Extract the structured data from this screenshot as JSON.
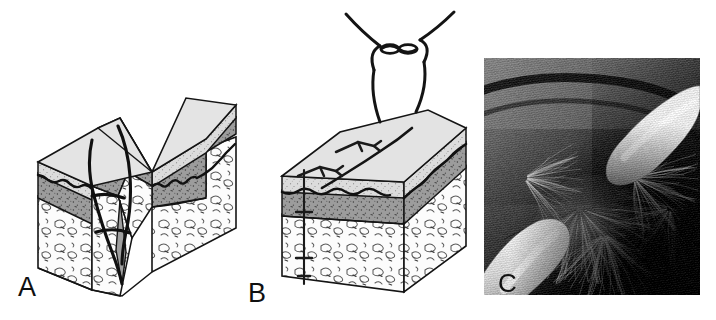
{
  "figure": {
    "kind": "medical-illustration-figure",
    "panel_count": 3,
    "background_color": "#ffffff",
    "width": 716,
    "height": 320
  },
  "panels": [
    {
      "id": "A",
      "label": "A",
      "label_x": 18,
      "label_y": 296,
      "title": "Gaping wound cross-section with suture needle path",
      "type": "line-illustration",
      "description": "Three-dimensional block diagram of skin split open by a deep V-shaped laceration. A curved suture thread loops through the wound edges from the epidermal surface down into the subcutaneous layer.",
      "layers": [
        {
          "name": "epidermis",
          "fill": "#d8d8d8",
          "texture": "fine stipple",
          "order": 1
        },
        {
          "name": "dermis",
          "fill": "#9a9a9a",
          "texture": "dense stipple with dashes",
          "order": 2
        },
        {
          "name": "subcutaneous-fat",
          "fill": "#fbfbfb",
          "texture": "lobulated squiggles",
          "order": 3
        }
      ],
      "features": [
        "gaping-wound",
        "suture-thread",
        "needle-path",
        "wavy-dermal-junction"
      ]
    },
    {
      "id": "B",
      "label": "B",
      "label_x": 248,
      "label_y": 302,
      "title": "Closed wound with tied suture knot",
      "type": "line-illustration",
      "description": "Same tissue block after closure. The laceration is approximated into a single line on the surface; a suture loop rises above the skin and is secured by a square knot with two free tails.",
      "layers": [
        {
          "name": "epidermis",
          "fill": "#d8d8d8",
          "texture": "fine stipple",
          "order": 1
        },
        {
          "name": "dermis",
          "fill": "#9a9a9a",
          "texture": "dense stipple with dashes",
          "order": 2
        },
        {
          "name": "subcutaneous-fat",
          "fill": "#fbfbfb",
          "texture": "lobulated squiggles",
          "order": 3
        }
      ],
      "features": [
        "closed-wound",
        "suture-knot",
        "knot-tails",
        "surface-closure-line",
        "vertical-suture-track"
      ]
    },
    {
      "id": "C",
      "label": "C",
      "label_x": 498,
      "label_y": 290,
      "title": "Clinical photograph of gloved fingers parting scalp hair",
      "type": "photograph",
      "tone": "grayscale halftone",
      "description": "Black-and-white clinical photograph. Two gloved fingertips press apart dark scalp hair to expose the skin beneath; one finger enters from the upper right, the other from the lower left.",
      "frame": {
        "x": 484,
        "y": 58,
        "width": 216,
        "height": 237
      },
      "features": [
        "gloved-finger-upper-right",
        "gloved-finger-lower-left",
        "dark-hair",
        "scalp-skin",
        "halftone-grain"
      ]
    }
  ],
  "colors": {
    "ink": "#111111",
    "epidermis": "#d8d8d8",
    "dermis": "#9a9a9a",
    "fat": "#fbfbfb",
    "suture": "#101010",
    "photo_dark": "#1d1d1d",
    "photo_mid": "#7a7a7a",
    "photo_light": "#e6e3dd"
  }
}
